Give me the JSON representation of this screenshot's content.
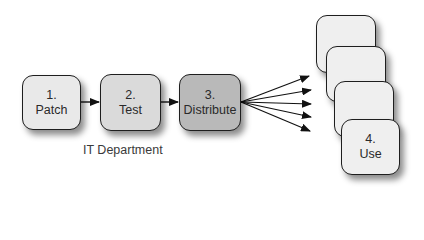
{
  "diagram": {
    "type": "process-flow",
    "steps": [
      {
        "number": "1.",
        "label": "Patch",
        "fill": "#e9e9e9"
      },
      {
        "number": "2.",
        "label": "Test",
        "fill": "#dadada"
      },
      {
        "number": "3.",
        "label": "Distribute",
        "fill": "#b9b9b9"
      }
    ],
    "group_caption": "IT Department",
    "fanout_arrow_count": 5,
    "destination_cards": [
      {
        "number": "",
        "label": "",
        "fill": "#efefef"
      },
      {
        "number": "",
        "label": "",
        "fill": "#efefef"
      },
      {
        "number": "",
        "label": "",
        "fill": "#efefef"
      },
      {
        "number": "4.",
        "label": "Use",
        "fill": "#efefef"
      }
    ],
    "colors": {
      "stroke": "#1e1e1e",
      "text": "#2a2a2a"
    }
  }
}
